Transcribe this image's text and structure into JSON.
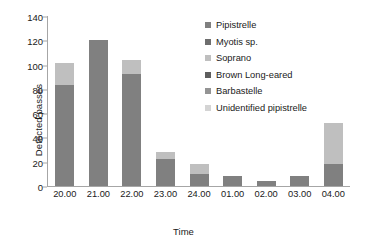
{
  "chart_data": {
    "type": "bar",
    "stacked": true,
    "title": "",
    "xlabel": "Time",
    "ylabel": "Detected passes",
    "categories": [
      "20.00",
      "21.00",
      "22.00",
      "23.00",
      "24.00",
      "01.00",
      "02.00",
      "03.00",
      "04.00"
    ],
    "ylim": [
      0,
      140
    ],
    "yticks": [
      0,
      20,
      40,
      60,
      80,
      100,
      120,
      140
    ],
    "grid": false,
    "legend_position": "right",
    "series": [
      {
        "name": "Pipistrelle",
        "color": "#808080",
        "values": [
          83,
          120,
          92,
          22,
          10,
          8,
          4,
          8,
          18
        ]
      },
      {
        "name": "Myotis sp.",
        "color": "#6E6E6E",
        "values": [
          0,
          0,
          0,
          0,
          0,
          0,
          0,
          0,
          0
        ]
      },
      {
        "name": "Soprano",
        "color": "#BFBFBF",
        "values": [
          18,
          0,
          12,
          6,
          8,
          0,
          0,
          0,
          34
        ]
      },
      {
        "name": "Brown Long-eared",
        "color": "#5E5E5E",
        "values": [
          0,
          0,
          0,
          0,
          0,
          0,
          0,
          0,
          0
        ]
      },
      {
        "name": "Barbastelle",
        "color": "#949494",
        "values": [
          0,
          0,
          0,
          0,
          0,
          0,
          0,
          0,
          0
        ]
      },
      {
        "name": "Unidentified pipistrelle",
        "color": "#D4D4D4",
        "values": [
          0,
          0,
          0,
          0,
          0,
          0,
          0,
          0,
          0
        ]
      }
    ],
    "totals": [
      101,
      120,
      104,
      28,
      18,
      8,
      4,
      8,
      52
    ]
  },
  "axes": {
    "y_title": "Detected passes",
    "x_title": "Time",
    "y_ticks": [
      "140",
      "120",
      "100",
      "80",
      "60",
      "40",
      "20",
      "0"
    ],
    "x_ticks": [
      "20.00",
      "21.00",
      "22.00",
      "23.00",
      "24.00",
      "01.00",
      "02.00",
      "03.00",
      "04.00"
    ]
  },
  "legend": {
    "items": [
      {
        "label": "Pipistrelle",
        "color": "#808080"
      },
      {
        "label": "Myotis sp.",
        "color": "#6E6E6E"
      },
      {
        "label": "Soprano",
        "color": "#BFBFBF"
      },
      {
        "label": "Brown Long-eared",
        "color": "#5E5E5E"
      },
      {
        "label": "Barbastelle",
        "color": "#949494"
      },
      {
        "label": "Unidentified pipistrelle",
        "color": "#D4D4D4"
      }
    ]
  },
  "colors": {
    "axis": "#a6a6a6",
    "text": "#1a1a1a",
    "background": "#ffffff"
  }
}
